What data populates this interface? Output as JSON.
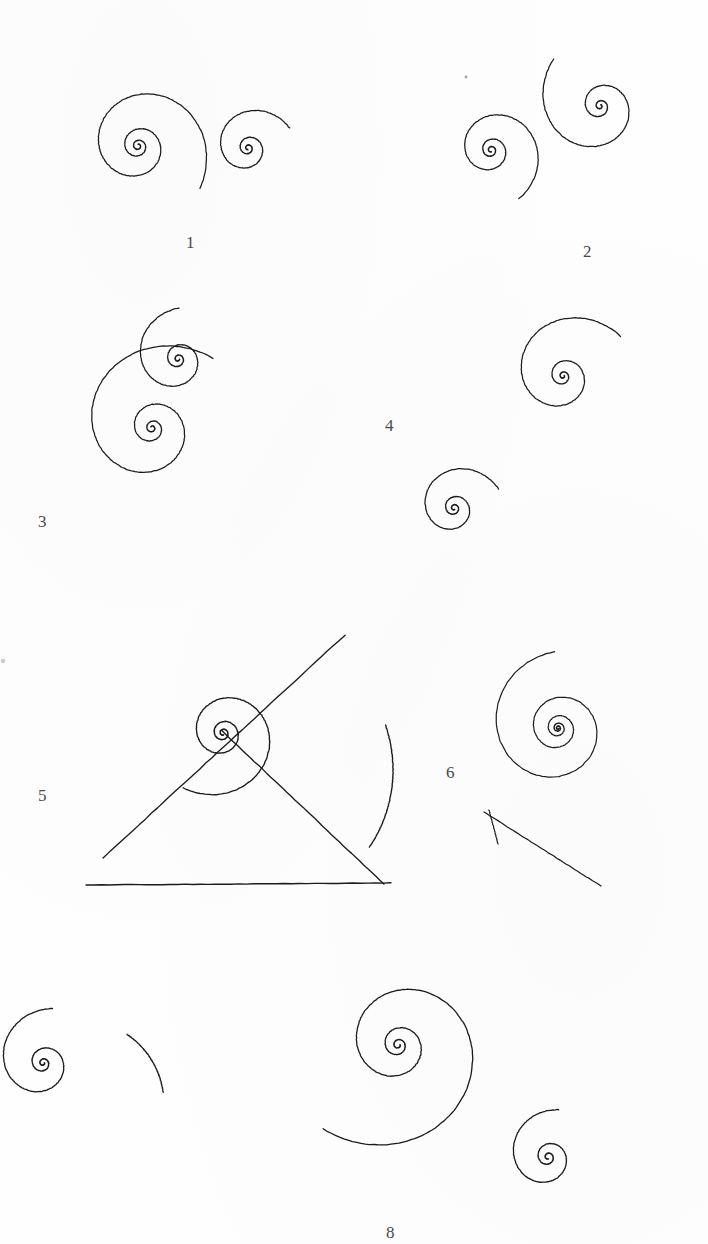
{
  "page": {
    "background_color": "#fefefe",
    "ink_color": "#1b1b1b",
    "label_color": "#4a4a4a",
    "width": 708,
    "height": 1244
  },
  "figures": [
    {
      "id": "figure-1",
      "label": "1",
      "label_x": 186,
      "label_y": 234,
      "curves": [
        {
          "name": "large-spiral",
          "type": "log",
          "cx": 138,
          "cy": 146,
          "a": 1.9,
          "b": 0.175,
          "t0": 0.0,
          "t1": 21.0,
          "rot": -1.55,
          "dir": 1,
          "w": 1.25
        },
        {
          "name": "small-spiral",
          "type": "log",
          "cx": 248,
          "cy": 148,
          "a": 1.6,
          "b": 0.2,
          "t0": 0.0,
          "t1": 16.8,
          "rot": 1.6,
          "dir": 1,
          "w": 1.25
        }
      ]
    },
    {
      "id": "figure-2",
      "label": "2",
      "label_x": 583,
      "label_y": 243,
      "curves": [
        {
          "name": "left-spiral",
          "type": "log",
          "cx": 491,
          "cy": 150,
          "a": 1.8,
          "b": 0.185,
          "t0": 0.0,
          "t1": 18.6,
          "rot": 1.3,
          "dir": 1,
          "w": 1.25
        },
        {
          "name": "right-spiral",
          "type": "log",
          "cx": 600,
          "cy": 106,
          "a": 1.5,
          "b": 0.215,
          "t0": 0.0,
          "t1": 17.6,
          "rot": -1.1,
          "dir": 1,
          "w": 1.25
        }
      ]
    },
    {
      "id": "figure-3",
      "label": "3",
      "label_x": 38,
      "label_y": 513,
      "curves": [
        {
          "name": "upper-small-spiral",
          "type": "log",
          "cx": 178,
          "cy": 359,
          "a": 1.5,
          "b": 0.205,
          "t0": 0.0,
          "t1": 17.2,
          "rot": 0.1,
          "dir": 1,
          "w": 1.25
        },
        {
          "name": "lower-large-spiral",
          "type": "log",
          "cx": 152,
          "cy": 428,
          "a": 1.7,
          "b": 0.196,
          "t0": 0.0,
          "t1": 20.4,
          "rot": -2.4,
          "dir": 1,
          "w": 1.25
        }
      ]
    },
    {
      "id": "figure-4",
      "label": "4",
      "label_x": 385,
      "label_y": 417,
      "curves": [
        {
          "name": "upper-right-spiral",
          "type": "log",
          "cx": 563,
          "cy": 376,
          "a": 1.3,
          "b": 0.212,
          "t0": 0.0,
          "t1": 18.8,
          "rot": -0.55,
          "dir": 1,
          "w": 1.25
        },
        {
          "name": "lower-left-spiral",
          "type": "log",
          "cx": 454,
          "cy": 508,
          "a": 1.6,
          "b": 0.196,
          "t0": 0.0,
          "t1": 17.4,
          "rot": 1.05,
          "dir": 1,
          "w": 1.25
        }
      ]
    },
    {
      "id": "figure-5",
      "label": "5",
      "label_x": 38,
      "label_y": 787,
      "curves": [
        {
          "name": "main-spiral",
          "type": "log",
          "cx": 223,
          "cy": 733,
          "a": 2.0,
          "b": 0.178,
          "t0": 0.0,
          "t1": 19.8,
          "rot": 1.25,
          "dir": 1,
          "w": 1.35
        },
        {
          "name": "baseline",
          "type": "line",
          "x1": 86,
          "y1": 885,
          "x2": 391,
          "y2": 883,
          "w": 1.4
        },
        {
          "name": "radial-axis",
          "type": "line",
          "x1": 103,
          "y1": 858,
          "x2": 345,
          "y2": 635,
          "w": 1.35
        },
        {
          "name": "tangent-line",
          "type": "line",
          "x1": 222,
          "y1": 731,
          "x2": 384,
          "y2": 884,
          "w": 1.35
        },
        {
          "name": "tangent-arc",
          "type": "arc",
          "cx": 255,
          "cy": 770,
          "r": 138,
          "a0": -19,
          "a1": 34,
          "w": 1.35
        }
      ]
    },
    {
      "id": "figure-6",
      "label": "6",
      "label_x": 446,
      "label_y": 764,
      "curves": [
        {
          "name": "dense-spiral",
          "type": "log",
          "cx": 558,
          "cy": 728,
          "a": 1.0,
          "b": 0.147,
          "t0": 0.0,
          "t1": 29.5,
          "rot": 0.3,
          "dir": 1,
          "w": 1.2
        },
        {
          "name": "tangent-line",
          "type": "line",
          "x1": 484,
          "y1": 812,
          "x2": 601,
          "y2": 886,
          "w": 1.2
        },
        {
          "name": "tangent-tail",
          "type": "line",
          "x1": 489,
          "y1": 810,
          "x2": 498,
          "y2": 844,
          "w": 1.2
        }
      ]
    },
    {
      "id": "figure-7",
      "label": "",
      "label_x": -100,
      "label_y": -100,
      "curves": [
        {
          "name": "cropped-spiral",
          "type": "log",
          "cx": 43,
          "cy": 1063,
          "a": 1.5,
          "b": 0.205,
          "t0": 0.0,
          "t1": 17.6,
          "rot": -0.15,
          "dir": 1,
          "w": 1.3
        },
        {
          "name": "cross-arc",
          "type": "arc",
          "cx": 80,
          "cy": 1104,
          "r": 84,
          "a0": -56,
          "a1": -8,
          "w": 1.3
        }
      ]
    },
    {
      "id": "figure-8",
      "label": "8",
      "label_x": 386,
      "label_y": 1224,
      "curves": [
        {
          "name": "large-spiral",
          "type": "log",
          "cx": 398,
          "cy": 1045,
          "a": 2.1,
          "b": 0.186,
          "t0": 0.0,
          "t1": 21.4,
          "rot": -0.25,
          "dir": 1,
          "w": 1.3
        },
        {
          "name": "small-spiral",
          "type": "log",
          "cx": 548,
          "cy": 1157,
          "a": 1.9,
          "b": 0.2,
          "t0": 0.0,
          "t1": 16.2,
          "rot": 1.3,
          "dir": 1,
          "w": 1.3
        }
      ]
    }
  ],
  "stray_marks": [
    {
      "name": "faint-dot-left-margin",
      "x": 3,
      "y": 661,
      "r": 2.2,
      "opacity": 0.22
    },
    {
      "name": "faint-dot-figure-2",
      "x": 466,
      "y": 77,
      "r": 1.4,
      "opacity": 0.4
    }
  ]
}
